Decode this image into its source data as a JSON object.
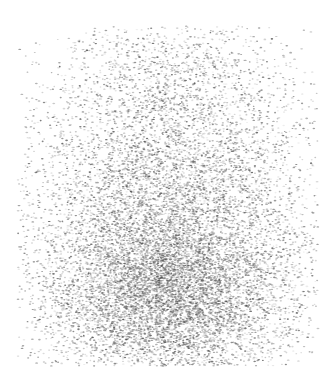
{
  "figure": {
    "width": 330,
    "height": 375,
    "background_color": "#ffffff",
    "has_axes": false,
    "has_border": false,
    "has_title": false,
    "has_legend": false,
    "has_gridlines": false,
    "has_tick_labels": false,
    "title": "",
    "subtitle": ""
  },
  "chart_data": {
    "type": "scatter",
    "title": "",
    "xlabel": "",
    "ylabel": "",
    "xlim": [
      0,
      330
    ],
    "ylim": [
      0,
      375
    ],
    "grid": false,
    "legend": null,
    "legend_position": "none",
    "axes_visible": false,
    "tick_labels_x": [],
    "tick_labels_y": [],
    "annotations": [],
    "background_color": "#ffffff",
    "marker": {
      "shape": "ellipse",
      "width_px": 2.2,
      "height_px": 1.3,
      "color": "#3a3a3a",
      "color_light": "#b5b5b5",
      "opacity_min": 0.18,
      "opacity_max": 0.78,
      "edge": "none"
    },
    "series": [
      {
        "name": "points",
        "n_points": 14000,
        "color": "#4a4a4a",
        "distribution": "bivariate-gaussian-mixture",
        "description": "Dense grayscale point cloud, density rising toward lower-center; tapering diffuse halo at all edges.",
        "extent": {
          "x_min": 18,
          "x_max": 318,
          "y_min": 26,
          "y_max": 366
        },
        "density_peak": {
          "x": 170,
          "y": 305
        },
        "components": [
          {
            "weight": 0.46,
            "mean_x": 168,
            "mean_y": 300,
            "sigma_x": 62,
            "sigma_y": 44
          },
          {
            "weight": 0.24,
            "mean_x": 172,
            "mean_y": 243,
            "sigma_x": 72,
            "sigma_y": 52
          },
          {
            "weight": 0.14,
            "mean_x": 166,
            "mean_y": 186,
            "sigma_x": 74,
            "sigma_y": 48
          },
          {
            "weight": 0.09,
            "mean_x": 170,
            "mean_y": 133,
            "sigma_x": 72,
            "sigma_y": 42
          },
          {
            "weight": 0.05,
            "mean_x": 168,
            "mean_y": 86,
            "sigma_x": 68,
            "sigma_y": 34
          },
          {
            "weight": 0.02,
            "mean_x": 168,
            "mean_y": 52,
            "sigma_x": 62,
            "sigma_y": 22
          }
        ],
        "density_profile_y": {
          "note": "Relative marker density sampled down the vertical axis.",
          "y_samples": [
            30,
            55,
            80,
            105,
            130,
            155,
            180,
            205,
            230,
            255,
            280,
            305,
            330,
            355
          ],
          "relative_density": [
            0.03,
            0.07,
            0.13,
            0.21,
            0.31,
            0.42,
            0.54,
            0.67,
            0.8,
            0.91,
            0.98,
            1.0,
            0.83,
            0.32
          ]
        },
        "density_profile_x": {
          "note": "Relative marker density sampled across the horizontal axis.",
          "x_samples": [
            20,
            50,
            80,
            110,
            140,
            170,
            200,
            230,
            260,
            290,
            315
          ],
          "relative_density": [
            0.09,
            0.32,
            0.62,
            0.85,
            0.97,
            1.0,
            0.96,
            0.83,
            0.6,
            0.3,
            0.08
          ]
        }
      }
    ]
  }
}
